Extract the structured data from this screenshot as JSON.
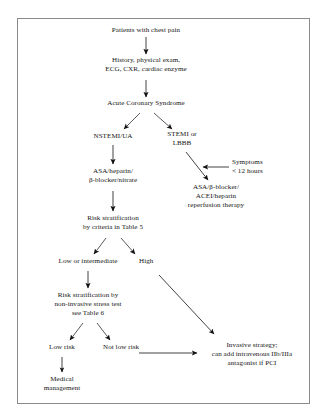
{
  "figure": {
    "type": "flowchart",
    "border_color": "#8a8a8a",
    "text_color": "#161616",
    "arrow_color": "#111111"
  },
  "nodes": {
    "chest_pain": {
      "line1": "Patients with chest pain"
    },
    "workup": {
      "line1": "History, physical exam,",
      "line2": "ECG, CXR, cardiac enzyme"
    },
    "acs": {
      "line1": "Acute Coronary Syndrome"
    },
    "nstemi": {
      "line1": "NSTEMI/UA"
    },
    "stemi": {
      "line1": "STEMI or",
      "line2": "LBBB"
    },
    "symptoms": {
      "line1": "Symptoms",
      "line2": "< 12 hours"
    },
    "asa_heparin": {
      "line1": "ASA/heparin/",
      "line2": "β-blocker/nitrate"
    },
    "reperfusion": {
      "line1": "ASA/β-blocker/",
      "line2": "ACEI/heparin",
      "line3": "reperfusion therapy"
    },
    "risk_table5": {
      "line1": "Risk stratification",
      "line2": "by criteria in Table 5"
    },
    "low_intermediate": {
      "line1": "Low or intermediate"
    },
    "high": {
      "line1": "High"
    },
    "risk_table6": {
      "line1": "Risk stratification by",
      "line2": "non-invasive stress test",
      "line3": "see Table 6"
    },
    "low_risk": {
      "line1": "Low risk"
    },
    "not_low_risk": {
      "line1": "Not low risk"
    },
    "medical": {
      "line1": "Medical",
      "line2": "management"
    },
    "invasive": {
      "line1": "Invasive strategy;",
      "line2": "can add intravenous IIb/IIIa",
      "line3": "antagonist if PCI"
    }
  }
}
